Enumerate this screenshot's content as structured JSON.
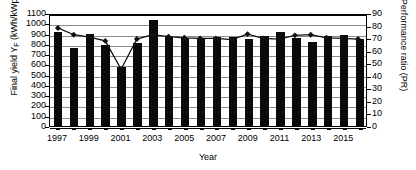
{
  "chart_data": {
    "type": "bar",
    "title": "",
    "xlabel": "Year",
    "ylabel": "Final yield YF (kWh/kWp)",
    "ylabel_main": "Final yield Y",
    "ylabel_sub": "F",
    "ylabel_rest": " (kWh/kWp)",
    "ylabel_secondary": "Performance ratio (PR)",
    "ylim": [
      0,
      1100
    ],
    "ylim_secondary": [
      0,
      90
    ],
    "ytick_step": 100,
    "ytick_step_secondary": 10,
    "grid": true,
    "legend": "none",
    "categories": [
      "1997",
      "1998",
      "1999",
      "2000",
      "2001",
      "2002",
      "2003",
      "2004",
      "2005",
      "2006",
      "2007",
      "2008",
      "2009",
      "2010",
      "2011",
      "2012",
      "2013",
      "2014",
      "2015",
      "2016"
    ],
    "xtick_labels": [
      "1997",
      "",
      "1999",
      "",
      "2001",
      "",
      "2003",
      "",
      "2005",
      "",
      "2007",
      "",
      "2009",
      "",
      "2011",
      "",
      "2013",
      "",
      "2015",
      ""
    ],
    "ytick_labels_left": [
      "0",
      "100",
      "200",
      "300",
      "400",
      "500",
      "600",
      "700",
      "800",
      "900",
      "1000",
      "1100"
    ],
    "ytick_labels_right": [
      "0",
      "10",
      "20",
      "30",
      "40",
      "50",
      "60",
      "70",
      "80",
      "90"
    ],
    "series": [
      {
        "name": "Final yield",
        "axis": "left",
        "type": "bar",
        "color": "#0a0a0a",
        "values": [
          915,
          760,
          900,
          785,
          575,
          810,
          1035,
          870,
          855,
          860,
          870,
          870,
          845,
          880,
          915,
          860,
          820,
          880,
          885,
          845
        ]
      },
      {
        "name": "Performance ratio",
        "axis": "right",
        "type": "line",
        "color": "#111111",
        "marker": "diamond",
        "values": [
          79.5,
          74.0,
          72.0,
          69.0,
          46.0,
          70.5,
          74.0,
          72.5,
          71.5,
          71.0,
          71.0,
          70.0,
          74.5,
          71.0,
          70.5,
          73.5,
          74.0,
          71.5,
          71.0,
          70.5
        ]
      }
    ]
  }
}
